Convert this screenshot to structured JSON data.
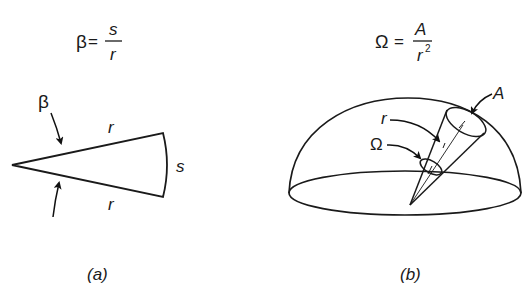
{
  "panel_a": {
    "formula": {
      "lhs": "β",
      "eq": "=",
      "num": "s",
      "den": "r"
    },
    "angle_label": "β",
    "side_top_label": "r",
    "side_bottom_label": "r",
    "arc_label": "s",
    "caption": "(a)"
  },
  "panel_b": {
    "formula": {
      "lhs": "Ω",
      "eq": "=",
      "num": "A",
      "den": "r",
      "den_exp": "2"
    },
    "area_label": "A",
    "radius_label": "r",
    "solid_angle_label": "Ω",
    "caption": "(b)"
  }
}
